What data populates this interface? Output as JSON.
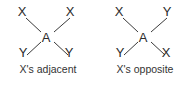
{
  "figure": {
    "background": "#ffffff",
    "stroke_color": "#3a3a3a",
    "text_color": "#2b2b2b"
  },
  "panels": [
    {
      "id": "x-adjacent",
      "caption": "X's adjacent",
      "center_label": "A",
      "nodes": {
        "top_left": "X",
        "top_right": "X",
        "center": "A",
        "bottom_left": "Y",
        "bottom_right": "Y"
      }
    },
    {
      "id": "x-opposite",
      "caption": "X's opposite",
      "center_label": "A",
      "nodes": {
        "top_left": "X",
        "top_right": "Y",
        "center": "A",
        "bottom_left": "Y",
        "bottom_right": "X"
      }
    }
  ]
}
